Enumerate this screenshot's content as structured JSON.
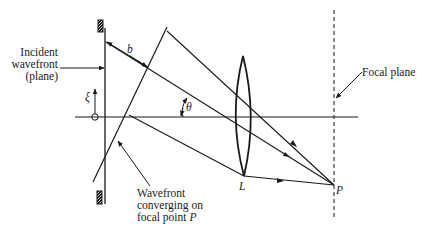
{
  "diagram": {
    "labels": {
      "incident_line1": "Incident",
      "incident_line2": "wavefront",
      "incident_line3": "(plane)",
      "wavefront_line1": "Wavefront",
      "wavefront_line2": "converging on",
      "wavefront_line3_prefix": "focal point ",
      "wavefront_line3_symbol": "P",
      "focal_plane": "Focal plane",
      "b": "b",
      "theta": "θ",
      "xi": "ξ",
      "L": "L",
      "P": "P"
    },
    "elements": [
      "aperture stop",
      "optical axis",
      "lens L",
      "focal plane",
      "three parallel rays",
      "tilted converging wavefront",
      "focal point P"
    ]
  }
}
